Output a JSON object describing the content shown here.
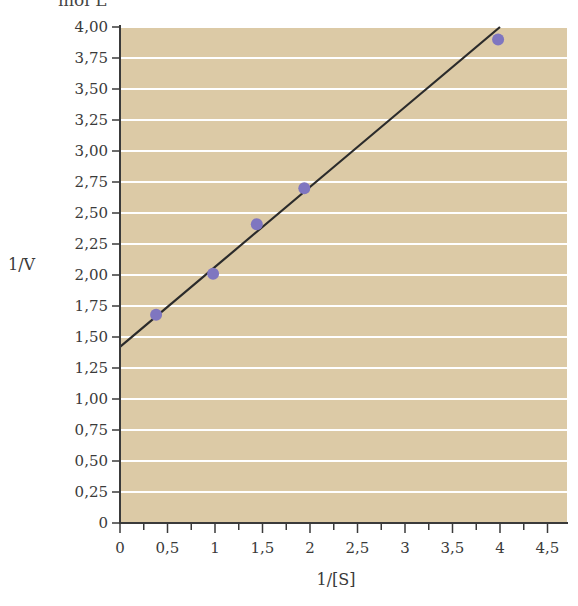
{
  "header_fragment": "mol L⁻¹",
  "chart_data": {
    "type": "scatter",
    "title": "",
    "xlabel": "1/[S]",
    "ylabel": "1/V",
    "xlim": [
      0,
      4.7
    ],
    "ylim": [
      0,
      4.0
    ],
    "x_ticks": [
      "0",
      "0,5",
      "1",
      "1,5",
      "2",
      "2,5",
      "3",
      "3,5",
      "4",
      "4,5"
    ],
    "y_ticks": [
      "0",
      "0,25",
      "0,50",
      "0,75",
      "1,00",
      "1,25",
      "1,50",
      "1,75",
      "2,00",
      "2,25",
      "2,50",
      "2,75",
      "3,00",
      "3,25",
      "3,50",
      "3,75",
      "4,00"
    ],
    "grid": "horizontal white lines every 0.25",
    "background_color": "#dccaa6",
    "point_color": "#7f76c0",
    "line_color": "#2b2b2b",
    "series": [
      {
        "name": "data points",
        "x": [
          0.38,
          0.98,
          1.44,
          1.94,
          3.98
        ],
        "y": [
          1.68,
          2.01,
          2.41,
          2.7,
          3.9
        ]
      }
    ],
    "fit_line": {
      "name": "linear fit",
      "x": [
        0,
        4.0
      ],
      "y": [
        1.42,
        4.0
      ]
    }
  }
}
